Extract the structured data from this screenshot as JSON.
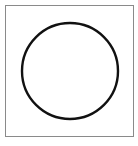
{
  "figure": {
    "frame": {
      "x": 5,
      "y": 5,
      "width": 129,
      "height": 132,
      "border_color": "#8a8a8a"
    },
    "circle": {
      "cx": 70,
      "cy": 71,
      "r": 48,
      "stroke_color": "#111111",
      "stroke_width": 2.4,
      "fill": "none"
    }
  }
}
